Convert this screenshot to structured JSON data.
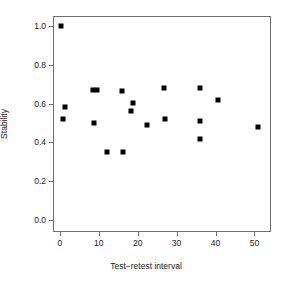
{
  "chart_data": {
    "type": "scatter",
    "title": "",
    "xlabel": "Test−retest interval",
    "ylabel": "Stability",
    "xlim": [
      -1.5,
      54.0
    ],
    "ylim": [
      -0.055,
      1.045
    ],
    "grid": false,
    "legend": null,
    "xticks": [
      0,
      10,
      20,
      30,
      40,
      50
    ],
    "xticklabels": [
      "0",
      "10",
      "20",
      "30",
      "40",
      "50"
    ],
    "yticks": [
      0.0,
      0.2,
      0.4,
      0.6,
      0.8,
      1.0
    ],
    "yticklabels": [
      "0.0",
      "0.2",
      "0.4",
      "0.6",
      "0.8",
      "1.0"
    ],
    "marker": "square",
    "marker_color": "#000000",
    "points": [
      {
        "x": 0.3,
        "y": 1.0
      },
      {
        "x": 0.7,
        "y": 0.52
      },
      {
        "x": 1.2,
        "y": 0.58
      },
      {
        "x": 8.6,
        "y": 0.67
      },
      {
        "x": 8.9,
        "y": 0.5
      },
      {
        "x": 9.6,
        "y": 0.67
      },
      {
        "x": 12.1,
        "y": 0.35
      },
      {
        "x": 16.0,
        "y": 0.665
      },
      {
        "x": 16.3,
        "y": 0.35
      },
      {
        "x": 18.2,
        "y": 0.56
      },
      {
        "x": 18.7,
        "y": 0.605
      },
      {
        "x": 22.4,
        "y": 0.49
      },
      {
        "x": 26.8,
        "y": 0.68
      },
      {
        "x": 27.1,
        "y": 0.52
      },
      {
        "x": 35.9,
        "y": 0.68
      },
      {
        "x": 35.9,
        "y": 0.51
      },
      {
        "x": 35.9,
        "y": 0.42
      },
      {
        "x": 40.6,
        "y": 0.62
      },
      {
        "x": 51.0,
        "y": 0.48
      }
    ]
  }
}
